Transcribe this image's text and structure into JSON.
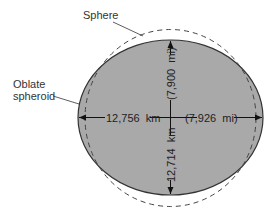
{
  "diagram": {
    "labels": {
      "sphere": "Sphere",
      "oblate_line1": "Oblate",
      "oblate_line2": "spheroid"
    },
    "dimensions": {
      "equatorial_km": "12,756  km",
      "equatorial_mi": "(7,926  mi)",
      "polar_km": "12,714  km",
      "polar_mi": "(7,900  mi)"
    },
    "colors": {
      "spheroid_fill": "#a9a9a9",
      "outline": "#333333",
      "sphere_dash": "#444444",
      "background": "#ffffff"
    }
  }
}
